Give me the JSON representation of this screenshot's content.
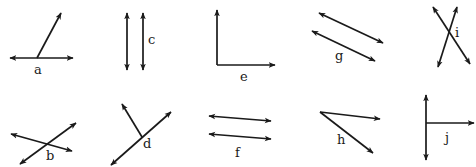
{
  "diagram": {
    "title": "",
    "stroke_color": "#1a1a1a",
    "background": "#ffffff",
    "figures": [
      {
        "id": "a",
        "label": "a",
        "type": "line-with-ray",
        "label_pos": [
          34,
          74
        ],
        "segments": [
          {
            "from": [
              10,
              58
            ],
            "to": [
              73,
              58
            ],
            "arrow_start": true,
            "arrow_end": true
          },
          {
            "from": [
              37,
              58
            ],
            "to": [
              61,
              13
            ],
            "arrow_start": false,
            "arrow_end": true
          }
        ]
      },
      {
        "id": "c",
        "label": "c",
        "type": "parallel-lines",
        "label_pos": [
          148,
          44
        ],
        "segments": [
          {
            "from": [
              127,
              13
            ],
            "to": [
              127,
              70
            ],
            "arrow_start": true,
            "arrow_end": true
          },
          {
            "from": [
              143,
              13
            ],
            "to": [
              143,
              70
            ],
            "arrow_start": true,
            "arrow_end": true
          }
        ]
      },
      {
        "id": "e",
        "label": "e",
        "type": "right-angle",
        "label_pos": [
          240,
          81
        ],
        "segments": [
          {
            "from": [
              217,
              65
            ],
            "to": [
              217,
              10
            ],
            "arrow_start": false,
            "arrow_end": true
          },
          {
            "from": [
              217,
              65
            ],
            "to": [
              275,
              65
            ],
            "arrow_start": false,
            "arrow_end": true
          }
        ]
      },
      {
        "id": "g",
        "label": "g",
        "type": "parallel-lines",
        "label_pos": [
          335,
          60
        ],
        "segments": [
          {
            "from": [
              319,
              13
            ],
            "to": [
              383,
              43
            ],
            "arrow_start": true,
            "arrow_end": true
          },
          {
            "from": [
              312,
              31
            ],
            "to": [
              375,
              61
            ],
            "arrow_start": true,
            "arrow_end": true
          }
        ]
      },
      {
        "id": "i",
        "label": "i",
        "type": "intersecting-lines",
        "label_pos": [
          455,
          37
        ],
        "segments": [
          {
            "from": [
              433,
              7
            ],
            "to": [
              470,
              64
            ],
            "arrow_start": true,
            "arrow_end": true
          },
          {
            "from": [
              457,
              7
            ],
            "to": [
              438,
              67
            ],
            "arrow_start": true,
            "arrow_end": true
          }
        ]
      },
      {
        "id": "b",
        "label": "b",
        "type": "intersecting-lines",
        "label_pos": [
          46,
          160
        ],
        "segments": [
          {
            "from": [
              11,
              134
            ],
            "to": [
              72,
              151
            ],
            "arrow_start": true,
            "arrow_end": true
          },
          {
            "from": [
              20,
              164
            ],
            "to": [
              76,
              123
            ],
            "arrow_start": true,
            "arrow_end": true
          }
        ]
      },
      {
        "id": "d",
        "label": "d",
        "type": "line-with-ray",
        "label_pos": [
          143,
          148
        ],
        "segments": [
          {
            "from": [
              111,
              165
            ],
            "to": [
              171,
              112
            ],
            "arrow_start": true,
            "arrow_end": true
          },
          {
            "from": [
              142,
              137
            ],
            "to": [
              122,
              104
            ],
            "arrow_start": false,
            "arrow_end": true
          }
        ]
      },
      {
        "id": "f",
        "label": "f",
        "type": "parallel-lines",
        "label_pos": [
          235,
          157
        ],
        "segments": [
          {
            "from": [
              209,
              116
            ],
            "to": [
              271,
              121
            ],
            "arrow_start": true,
            "arrow_end": true
          },
          {
            "from": [
              209,
              134
            ],
            "to": [
              271,
              139
            ],
            "arrow_start": true,
            "arrow_end": true
          }
        ]
      },
      {
        "id": "h",
        "label": "h",
        "type": "angle",
        "label_pos": [
          337,
          144
        ],
        "segments": [
          {
            "from": [
              320,
              112
            ],
            "to": [
              380,
              119
            ],
            "arrow_start": false,
            "arrow_end": true
          },
          {
            "from": [
              320,
              112
            ],
            "to": [
              373,
              153
            ],
            "arrow_start": false,
            "arrow_end": true
          }
        ]
      },
      {
        "id": "j",
        "label": "j",
        "type": "line-with-ray",
        "label_pos": [
          445,
          142
        ],
        "segments": [
          {
            "from": [
              426,
              95
            ],
            "to": [
              426,
              160
            ],
            "arrow_start": true,
            "arrow_end": true
          },
          {
            "from": [
              426,
              123
            ],
            "to": [
              474,
              123
            ],
            "arrow_start": false,
            "arrow_end": true
          }
        ]
      }
    ]
  }
}
